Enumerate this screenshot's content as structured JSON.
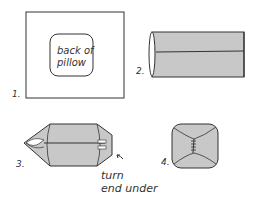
{
  "figure": {
    "panels": [
      {
        "number": "1.",
        "inner_label_line1": "back of",
        "inner_label_line2": "pillow"
      },
      {
        "number": "2."
      },
      {
        "number": "3.",
        "annotation_line1": "turn",
        "annotation_line2": "end under"
      },
      {
        "number": "4."
      }
    ],
    "colors": {
      "fill": "#c8c8c8",
      "stroke": "#333333"
    }
  }
}
